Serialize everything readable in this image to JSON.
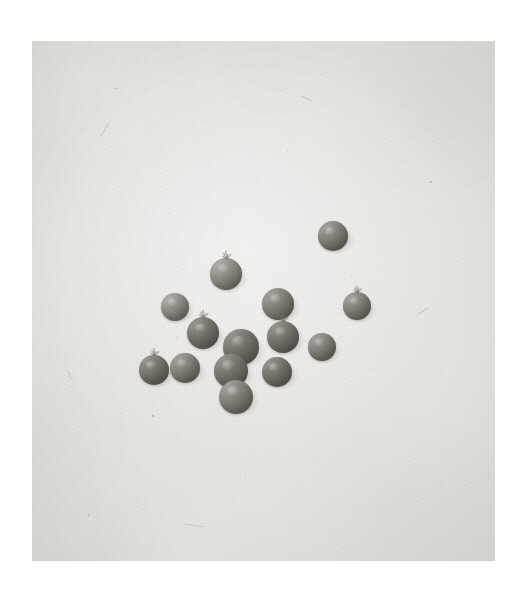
{
  "document": {
    "type": "photograph",
    "title": "Cluster of small round fruits on plain backdrop",
    "medium": "black-and-white photographic print",
    "canvas": {
      "width": 527,
      "height": 591,
      "background_color": "#ffffff"
    },
    "plate": {
      "name": "photo-plate",
      "left": 32,
      "top": 41,
      "width": 463,
      "height": 520,
      "background_color": "#e5e4e1",
      "edge_shade_color": "#d7d5d1",
      "border_color": "#ffffff"
    }
  },
  "palette": {
    "paper_white": "#ffffff",
    "backdrop_light": "#e9e8e5",
    "backdrop_mid": "#e5e4e1",
    "backdrop_dark": "#d7d5d1",
    "fruit_highlight": "#a8a4a0",
    "fruit_mid": "#85817a",
    "fruit_shadow": "#615d57",
    "stem_color": "#767268",
    "cast_shadow": "#5c5854"
  },
  "subject": {
    "label": "fruit-cluster",
    "count": 14,
    "description": "Fourteen small spherical fruits (tomatoes/berries) arranged loosely in a diagonal cluster across the middle of the frame; a few retain short calyx stems.",
    "items": [
      {
        "id": 1,
        "name": "fruit-top-right-outlier",
        "cx": 333,
        "cy": 236,
        "r": 15,
        "tone": "mid",
        "has_calyx": false,
        "light_angle": 32
      },
      {
        "id": 2,
        "name": "fruit-upper-stemmed",
        "cx": 226,
        "cy": 274,
        "r": 16,
        "tone": "light",
        "has_calyx": true,
        "light_angle": 28
      },
      {
        "id": 3,
        "name": "fruit-left-pale",
        "cx": 175,
        "cy": 307,
        "r": 14,
        "tone": "light",
        "has_calyx": false,
        "light_angle": 35
      },
      {
        "id": 4,
        "name": "fruit-center-upper",
        "cx": 278,
        "cy": 304,
        "r": 16,
        "tone": "mid",
        "has_calyx": false,
        "light_angle": 30
      },
      {
        "id": 5,
        "name": "fruit-right-stemmed",
        "cx": 357,
        "cy": 306,
        "r": 14,
        "tone": "mid",
        "has_calyx": true,
        "light_angle": 26
      },
      {
        "id": 6,
        "name": "fruit-left-mid",
        "cx": 203,
        "cy": 333,
        "r": 16,
        "tone": "dark",
        "has_calyx": true,
        "light_angle": 34
      },
      {
        "id": 7,
        "name": "fruit-center-core",
        "cx": 241,
        "cy": 347,
        "r": 18,
        "tone": "dark",
        "has_calyx": false,
        "light_angle": 30
      },
      {
        "id": 8,
        "name": "fruit-center-right",
        "cx": 283,
        "cy": 337,
        "r": 16,
        "tone": "dark",
        "has_calyx": true,
        "light_angle": 29
      },
      {
        "id": 9,
        "name": "fruit-right-small",
        "cx": 322,
        "cy": 347,
        "r": 14,
        "tone": "mid",
        "has_calyx": false,
        "light_angle": 31
      },
      {
        "id": 10,
        "name": "fruit-far-left-low",
        "cx": 154,
        "cy": 370,
        "r": 15,
        "tone": "dark",
        "has_calyx": true,
        "light_angle": 36
      },
      {
        "id": 11,
        "name": "fruit-left-low",
        "cx": 185,
        "cy": 368,
        "r": 15,
        "tone": "mid",
        "has_calyx": false,
        "light_angle": 33
      },
      {
        "id": 12,
        "name": "fruit-center-low",
        "cx": 231,
        "cy": 371,
        "r": 17,
        "tone": "dark",
        "has_calyx": false,
        "light_angle": 30
      },
      {
        "id": 13,
        "name": "fruit-lower-right",
        "cx": 277,
        "cy": 372,
        "r": 15,
        "tone": "dark",
        "has_calyx": false,
        "light_angle": 30
      },
      {
        "id": 14,
        "name": "fruit-bottom",
        "cx": 236,
        "cy": 397,
        "r": 17,
        "tone": "mid",
        "has_calyx": false,
        "light_angle": 28
      }
    ]
  },
  "texture": {
    "specks": [
      {
        "x": 0.18,
        "y": 0.09,
        "d": 1.6
      },
      {
        "x": 0.63,
        "y": 0.06,
        "d": 1.2
      },
      {
        "x": 0.86,
        "y": 0.27,
        "d": 1.4
      },
      {
        "x": 0.09,
        "y": 0.38,
        "d": 1.3
      },
      {
        "x": 0.31,
        "y": 0.57,
        "d": 1.1
      },
      {
        "x": 0.74,
        "y": 0.63,
        "d": 1.5
      },
      {
        "x": 0.46,
        "y": 0.84,
        "d": 1.2
      },
      {
        "x": 0.12,
        "y": 0.91,
        "d": 1.4
      },
      {
        "x": 0.92,
        "y": 0.79,
        "d": 1.1
      },
      {
        "x": 0.55,
        "y": 0.21,
        "d": 1.0
      },
      {
        "x": 0.26,
        "y": 0.72,
        "d": 1.3
      },
      {
        "x": 0.69,
        "y": 0.45,
        "d": 1.0
      }
    ],
    "scratches": [
      {
        "x": 0.14,
        "y": 0.17,
        "len": 16,
        "angle": -58,
        "thick": 1
      },
      {
        "x": 0.58,
        "y": 0.11,
        "len": 11,
        "angle": 22,
        "thick": 1
      },
      {
        "x": 0.83,
        "y": 0.52,
        "len": 13,
        "angle": -31,
        "thick": 1
      },
      {
        "x": 0.33,
        "y": 0.93,
        "len": 18,
        "angle": 8,
        "thick": 1
      },
      {
        "x": 0.07,
        "y": 0.64,
        "len": 10,
        "angle": 67,
        "thick": 1
      }
    ]
  }
}
